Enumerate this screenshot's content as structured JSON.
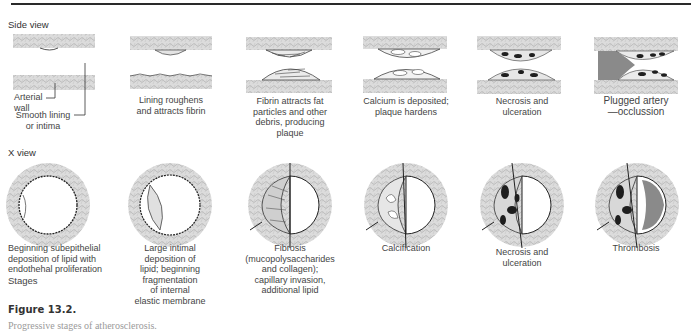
{
  "figure": {
    "title": "Figure 13.2.",
    "caption": "Progressive stages of atherosclerosis."
  },
  "side_view": {
    "label": "Side view",
    "annotations": {
      "arterial_wall": "Arterial\nwall",
      "smooth_lining": "Smooth lining\nor intima"
    },
    "panels": [
      {
        "caption": ""
      },
      {
        "caption": "Lining roughens\nand attracts fibrin"
      },
      {
        "caption": "Fibrin attracts fat\nparticles and other\ndebris, producing\nplaque"
      },
      {
        "caption": "Calcium is deposited;\nplaque hardens"
      },
      {
        "caption": "Necrosis and\nulceration"
      },
      {
        "caption": "Plugged artery\n—occlussion"
      }
    ]
  },
  "x_view": {
    "label": "X view",
    "stages_label": "Stages",
    "panels": [
      {
        "caption": "Beginning subepithelial\ndeposition of lipid with\nendothehal proliferation"
      },
      {
        "caption": "Large intimal\ndeposition of\nlipid; beginning\nfragmentation\nof internal\nelastic membrane"
      },
      {
        "caption": "Fibrosis\n(mucopolysaccharides\nand collagen);\ncapillary invasion,\nadditional lipid"
      },
      {
        "caption": "Calcification"
      },
      {
        "caption": "Necrosis and\nulceration"
      },
      {
        "caption": "Thrombosis"
      }
    ]
  },
  "colors": {
    "wall": "#d8d8d8",
    "wall_texture": "#bdbdbd",
    "plaque": "#e6e6e6",
    "necrosis": "#1e1e1e",
    "thrombus": "#8a8a8a",
    "rule": "#2a2a2a"
  }
}
